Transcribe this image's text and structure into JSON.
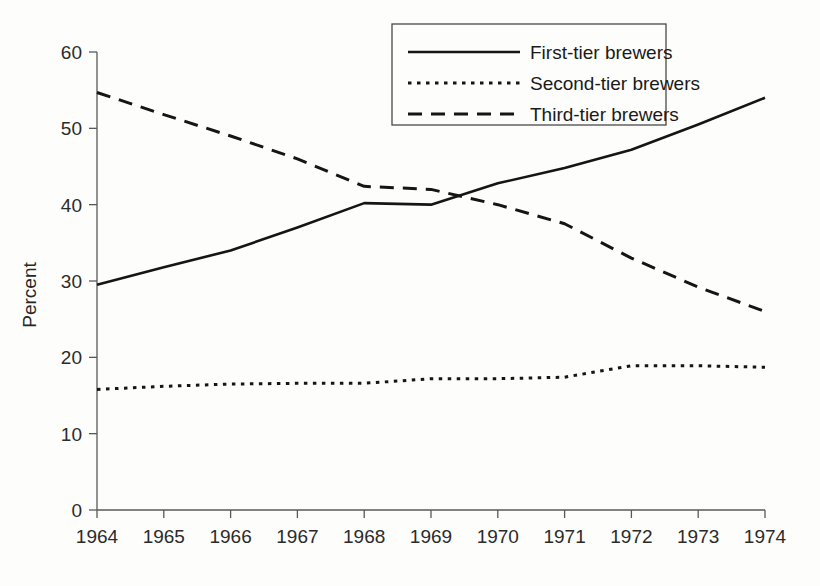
{
  "chart_data": {
    "type": "line",
    "title": "",
    "xlabel": "",
    "ylabel": "Percent",
    "categories": [
      "1964",
      "1965",
      "1966",
      "1967",
      "1968",
      "1969",
      "1970",
      "1971",
      "1972",
      "1973",
      "1974"
    ],
    "x": [
      1964,
      1965,
      1966,
      1967,
      1968,
      1969,
      1970,
      1971,
      1972,
      1973,
      1974
    ],
    "xlim": [
      1964,
      1974
    ],
    "ylim": [
      0,
      60
    ],
    "yticks": [
      0,
      10,
      20,
      30,
      40,
      50,
      60
    ],
    "ytick_labels": [
      "0",
      "10",
      "20",
      "30",
      "40",
      "50",
      "60"
    ],
    "grid": false,
    "legend_position": "top-center",
    "series": [
      {
        "name": "First-tier brewers",
        "style": "solid",
        "color": "#151515",
        "values": [
          29.5,
          31.8,
          34.0,
          37.0,
          40.2,
          40.0,
          42.8,
          44.8,
          47.2,
          50.5,
          54.0
        ]
      },
      {
        "name": "Second-tier brewers",
        "style": "dotted",
        "color": "#151515",
        "values": [
          15.8,
          16.2,
          16.5,
          16.6,
          16.6,
          17.2,
          17.2,
          17.4,
          18.9,
          18.9,
          18.7
        ]
      },
      {
        "name": "Third-tier brewers",
        "style": "dashed",
        "color": "#151515",
        "values": [
          54.7,
          51.8,
          49.0,
          46.0,
          42.4,
          42.0,
          40.0,
          37.5,
          33.0,
          29.2,
          26.0
        ]
      }
    ]
  },
  "axes": {
    "y_axis_title": "Percent",
    "y_tick_labels": [
      "60",
      "50",
      "40",
      "30",
      "20",
      "10",
      "0"
    ],
    "x_tick_labels": [
      "1964",
      "1965",
      "1966",
      "1967",
      "1968",
      "1969",
      "1970",
      "1971",
      "1972",
      "1973",
      "1974"
    ]
  },
  "legend": {
    "entries": [
      {
        "label": "First-tier brewers",
        "style": "solid"
      },
      {
        "label": "Second-tier brewers",
        "style": "dotted"
      },
      {
        "label": "Third-tier brewers",
        "style": "dashed"
      }
    ]
  },
  "colors": {
    "background": "#fdfdfb",
    "ink": "#151515",
    "axis": "#595959"
  }
}
